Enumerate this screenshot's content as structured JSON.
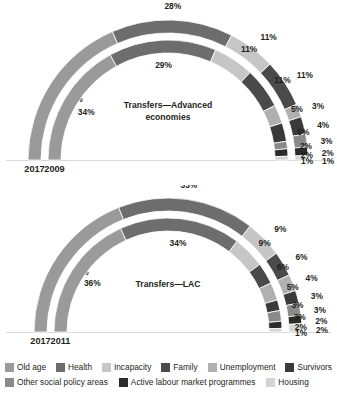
{
  "chart_data": {
    "type": "pie",
    "title": "",
    "subtype": "stacked semi-circular doughnut, two rings per panel",
    "categories": [
      "Old age",
      "Health",
      "Incapacity",
      "Family",
      "Unemployment",
      "Survivors",
      "Other social policy areas",
      "Active labour market programmes",
      "Housing"
    ],
    "colors": [
      "#9a9a9a",
      "#6d6d6d",
      "#c6c6c6",
      "#4a4a4a",
      "#b0b0b0",
      "#3a3a3a",
      "#8a8a8a",
      "#2b2b2b",
      "#d4d4d4"
    ],
    "unit": "%",
    "panels": [
      {
        "name": "Transfers—Advanced economies",
        "title": "Transfers—Advanced economies",
        "rings": [
          {
            "year": "2017",
            "ring": "outer",
            "values": [
              37,
              28,
              11,
              11,
              3,
              4,
              3,
              2,
              1
            ],
            "labels": [
              "37%",
              "28%",
              "11%",
              "11%",
              "3%",
              "4%",
              "3%",
              "2%",
              "1%"
            ]
          },
          {
            "year": "2009",
            "ring": "inner",
            "values": [
              34,
              29,
              11,
              11,
              5,
              5,
              2,
              2,
              1
            ],
            "labels": [
              "34%",
              "29%",
              "11%",
              "11%",
              "5%",
              "5%",
              "2%",
              "2%",
              "1%"
            ]
          }
        ]
      },
      {
        "name": "Transfers—LAC",
        "title": "Transfers—LAC",
        "rings": [
          {
            "year": "2017",
            "ring": "outer",
            "values": [
              38,
              33,
              9,
              6,
              4,
              3,
              3,
              2,
              2
            ],
            "labels": [
              "38%",
              "33%",
              "9%",
              "6%",
              "4%",
              "3%",
              "3%",
              "2%",
              "2%"
            ]
          },
          {
            "year": "2011",
            "ring": "inner",
            "values": [
              36,
              34,
              9,
              6,
              5,
              3,
              3,
              2,
              1
            ],
            "labels": [
              "36%",
              "34%",
              "9%",
              "6%",
              "5%",
              "3%",
              "3%",
              "2%",
              "1%"
            ]
          }
        ]
      }
    ],
    "legend": {
      "position": "bottom",
      "rows": [
        [
          {
            "label": "Old age",
            "color": "#9a9a9a"
          },
          {
            "label": "Health",
            "color": "#6d6d6d"
          },
          {
            "label": "Incapacity",
            "color": "#c6c6c6"
          },
          {
            "label": "Family",
            "color": "#4a4a4a"
          },
          {
            "label": "Unemployment",
            "color": "#b0b0b0"
          },
          {
            "label": "Survivors",
            "color": "#3a3a3a"
          }
        ],
        [
          {
            "label": "Other social policy areas",
            "color": "#8a8a8a"
          },
          {
            "label": "Active labour market programmes",
            "color": "#2b2b2b"
          },
          {
            "label": "Housing",
            "color": "#d4d4d4"
          }
        ]
      ]
    }
  }
}
